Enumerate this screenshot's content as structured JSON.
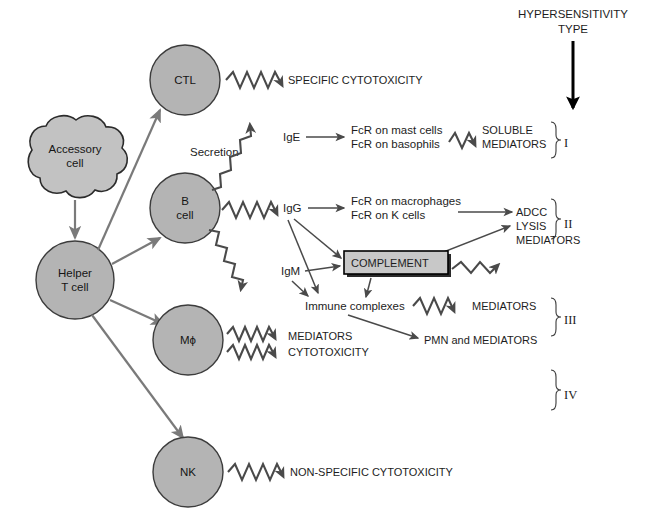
{
  "diagram": {
    "header": {
      "line1": "HYPERSENSITIVITY",
      "line2": "TYPE"
    },
    "cells": {
      "accessory": "Accessory\ncell",
      "accessory_line1": "Accessory",
      "accessory_line2": "cell",
      "helper_line1": "Helper",
      "helper_line2": "T cell",
      "ctl": "CTL",
      "bcell_line1": "B",
      "bcell_line2": "cell",
      "macrophage": "Mϕ",
      "nk": "NK"
    },
    "labels": {
      "secretion": "Secretion",
      "ige": "IgE",
      "igg": "IgG",
      "igm": "IgM",
      "immune_complexes": "Immune complexes",
      "complement": "COMPLEMENT",
      "specific_cytotoxicity": "SPECIFIC CYTOTOXICITY",
      "fcr_mast": "FcR on mast cells",
      "fcr_basophils": "FcR on basophils",
      "soluble": "SOLUBLE",
      "mediators_soluble": "MEDIATORS",
      "fcr_macrophages": "FcR on macrophages",
      "fcr_kcells": "FcR on K cells",
      "adcc": "ADCC",
      "lysis": "LYSIS",
      "mediators_lysis": "MEDIATORS",
      "mediators_ic": "MEDIATORS",
      "pmn_and_mediators": "PMN and MEDIATORS",
      "mediators_mac": "MEDIATORS",
      "cytotoxicity_mac": "CYTOTOXICITY",
      "nonspecific_cytotoxicity": "NON-SPECIFIC CYTOTOXICITY"
    },
    "types": {
      "type1": "I",
      "type2": "II",
      "type3": "III",
      "type4": "IV"
    },
    "colors": {
      "cell_fill": "#b4b4b4",
      "cell_stroke": "#3c3c3c",
      "arrow_gray": "#7a7a7a",
      "arrow_dark": "#4a4a4a",
      "box_fill": "#c8c8c8",
      "text": "#1d1d1d",
      "background": "#ffffff"
    }
  }
}
